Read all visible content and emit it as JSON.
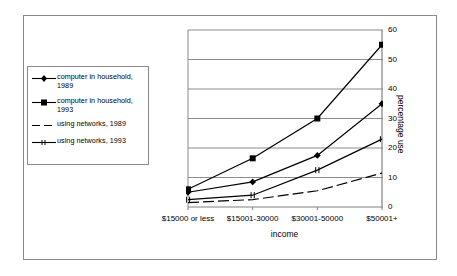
{
  "chart_data": {
    "type": "line",
    "title": "",
    "xlabel": "income",
    "ylabel": "percentage use",
    "categories": [
      "$15000 or less",
      "$15001-30000",
      "$30001-50000",
      "$50001+"
    ],
    "ylim": [
      0,
      60
    ],
    "yticks": [
      0,
      10,
      20,
      30,
      40,
      50,
      60
    ],
    "ytick_labels": [
      "0",
      "10",
      "20",
      "30",
      "40",
      "50",
      "60"
    ],
    "grid": "horizontal",
    "legend_position": "left-outside",
    "series": [
      {
        "name": "computer in household, 1989",
        "marker": "diamond",
        "line": "solid",
        "values": [
          5,
          8.5,
          17.5,
          35
        ]
      },
      {
        "name": "computer in household, 1993",
        "marker": "square",
        "line": "solid",
        "values": [
          6,
          16.5,
          30,
          55
        ]
      },
      {
        "name": "using networks, 1989",
        "marker": "none",
        "line": "dashed",
        "values": [
          1.5,
          2.5,
          5.5,
          11.5
        ]
      },
      {
        "name": "using networks, 1993",
        "marker": "tick",
        "line": "solid",
        "values": [
          2.5,
          4,
          12.5,
          23
        ]
      }
    ]
  },
  "legend": {
    "items": [
      {
        "label": "computer in household,\n1989",
        "key": "diamond-line-key"
      },
      {
        "label": "computer in household,\n1993",
        "key": "square-line-key"
      },
      {
        "label": "using networks, 1989",
        "key": "dashed-line-key"
      },
      {
        "label": "using networks, 1993",
        "key": "tick-line-key"
      }
    ]
  },
  "axes": {
    "x_label": "income",
    "y_label": "percentage use",
    "x_tick_labels": [
      "$15000 or less",
      "$15001-30000",
      "$30001-50000",
      "$50001+"
    ],
    "y_tick_labels": [
      "60",
      "50",
      "40",
      "30",
      "20",
      "10",
      "0"
    ]
  },
  "colors": {
    "line": "#000000",
    "grid": "#808080",
    "axis": "#808080",
    "frame": "#8a8a8a",
    "background": "#ffffff"
  }
}
